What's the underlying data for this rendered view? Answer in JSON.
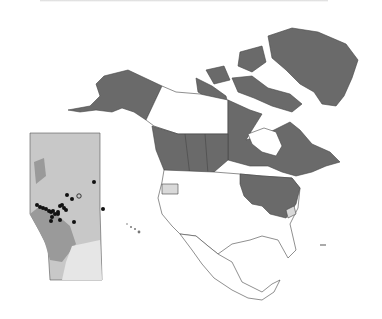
{
  "figure": {
    "type": "species-distribution-map",
    "region": "North America",
    "inset_region": "Alberta",
    "colors": {
      "present": "#6a6a6a",
      "absent": "#ffffff",
      "uncertain": "#d9d9d9",
      "border": "#444444",
      "inset_bg": "#c8c8c8",
      "inset_mountains": "#9a9a9a",
      "inset_grassland": "#e6e6e6",
      "record_point": "#111111"
    },
    "inset_records": {
      "filled_points": 22,
      "open_points": 1
    }
  }
}
